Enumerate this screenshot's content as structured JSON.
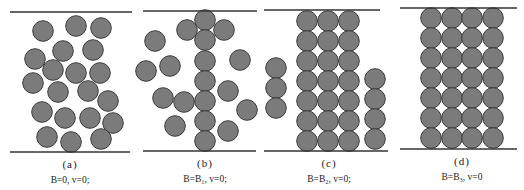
{
  "figure": {
    "circle_radius": 10.3,
    "colors": {
      "particle_fill": "#7b7b7b",
      "particle_stroke": "#3c3c3c",
      "plate": "#333333",
      "text": "#222222"
    },
    "panels": [
      {
        "id": "a",
        "label": "(a)",
        "caption": "B=0, v=0;",
        "label_pos": [
          70,
          158
        ],
        "caption_pos": [
          70,
          175
        ],
        "top_plate": [
          10,
          132,
          12
        ],
        "bottom_plate": [
          10,
          130,
          152
        ],
        "particles": [
          [
            43,
            31
          ],
          [
            76,
            26
          ],
          [
            101,
            28
          ],
          [
            63,
            51
          ],
          [
            93,
            50
          ],
          [
            35,
            59
          ],
          [
            53,
            70
          ],
          [
            76,
            73
          ],
          [
            100,
            73
          ],
          [
            33,
            83
          ],
          [
            58,
            92
          ],
          [
            88,
            91
          ],
          [
            108,
            101
          ],
          [
            42,
            112
          ],
          [
            65,
            118
          ],
          [
            90,
            118
          ],
          [
            113,
            123
          ],
          [
            47,
            137
          ],
          [
            71,
            142
          ],
          [
            101,
            139
          ]
        ]
      },
      {
        "id": "b",
        "label": "(b)",
        "caption": "B=B₁, v=0;",
        "label_pos": [
          205,
          157
        ],
        "caption_pos": [
          205,
          174
        ],
        "top_plate": [
          143,
          257,
          11
        ],
        "bottom_plate": [
          143,
          256,
          151
        ],
        "particles": [
          [
            205,
            20
          ],
          [
            205,
            40
          ],
          [
            205,
            61
          ],
          [
            205,
            81
          ],
          [
            205,
            101
          ],
          [
            205,
            121
          ],
          [
            205,
            141
          ],
          [
            187,
            30
          ],
          [
            224,
            30
          ],
          [
            155,
            41
          ],
          [
            170,
            66
          ],
          [
            146,
            71
          ],
          [
            240,
            60
          ],
          [
            163,
            98
          ],
          [
            184,
            102
          ],
          [
            228,
            91
          ],
          [
            247,
            110
          ],
          [
            175,
            126
          ],
          [
            228,
            131
          ]
        ]
      },
      {
        "id": "c",
        "label": "(c)",
        "caption": "B=B₂, v=0;",
        "label_pos": [
          329,
          157
        ],
        "caption_pos": [
          329,
          174
        ],
        "top_plate": [
          264,
          380,
          10
        ],
        "bottom_plate": [
          264,
          388,
          151
        ],
        "particles": [
          [
            307,
            21
          ],
          [
            328,
            21
          ],
          [
            349,
            21
          ],
          [
            307,
            41
          ],
          [
            328,
            41
          ],
          [
            349,
            41
          ],
          [
            307,
            61
          ],
          [
            328,
            61
          ],
          [
            349,
            61
          ],
          [
            307,
            81
          ],
          [
            328,
            81
          ],
          [
            349,
            81
          ],
          [
            307,
            101
          ],
          [
            328,
            101
          ],
          [
            349,
            101
          ],
          [
            307,
            121
          ],
          [
            328,
            121
          ],
          [
            349,
            121
          ],
          [
            307,
            141
          ],
          [
            328,
            141
          ],
          [
            349,
            141
          ],
          [
            276,
            68
          ],
          [
            276,
            88
          ],
          [
            276,
            108
          ],
          [
            375,
            79
          ],
          [
            375,
            99
          ],
          [
            375,
            119
          ],
          [
            375,
            139
          ]
        ]
      },
      {
        "id": "d",
        "label": "(d)",
        "caption": "B=B₃, v=0",
        "label_pos": [
          462,
          155
        ],
        "caption_pos": [
          462,
          172
        ],
        "top_plate": [
          400,
          517,
          8
        ],
        "bottom_plate": [
          400,
          517,
          149
        ],
        "particles": [
          [
            431,
            18
          ],
          [
            452,
            18
          ],
          [
            472,
            18
          ],
          [
            493,
            18
          ],
          [
            431,
            38
          ],
          [
            452,
            38
          ],
          [
            472,
            38
          ],
          [
            493,
            38
          ],
          [
            431,
            58
          ],
          [
            452,
            58
          ],
          [
            472,
            58
          ],
          [
            493,
            58
          ],
          [
            431,
            78
          ],
          [
            452,
            78
          ],
          [
            472,
            78
          ],
          [
            493,
            78
          ],
          [
            431,
            98
          ],
          [
            452,
            98
          ],
          [
            472,
            98
          ],
          [
            493,
            98
          ],
          [
            431,
            118
          ],
          [
            452,
            118
          ],
          [
            472,
            118
          ],
          [
            493,
            118
          ],
          [
            431,
            138
          ],
          [
            452,
            138
          ],
          [
            472,
            138
          ],
          [
            493,
            138
          ]
        ]
      }
    ]
  }
}
